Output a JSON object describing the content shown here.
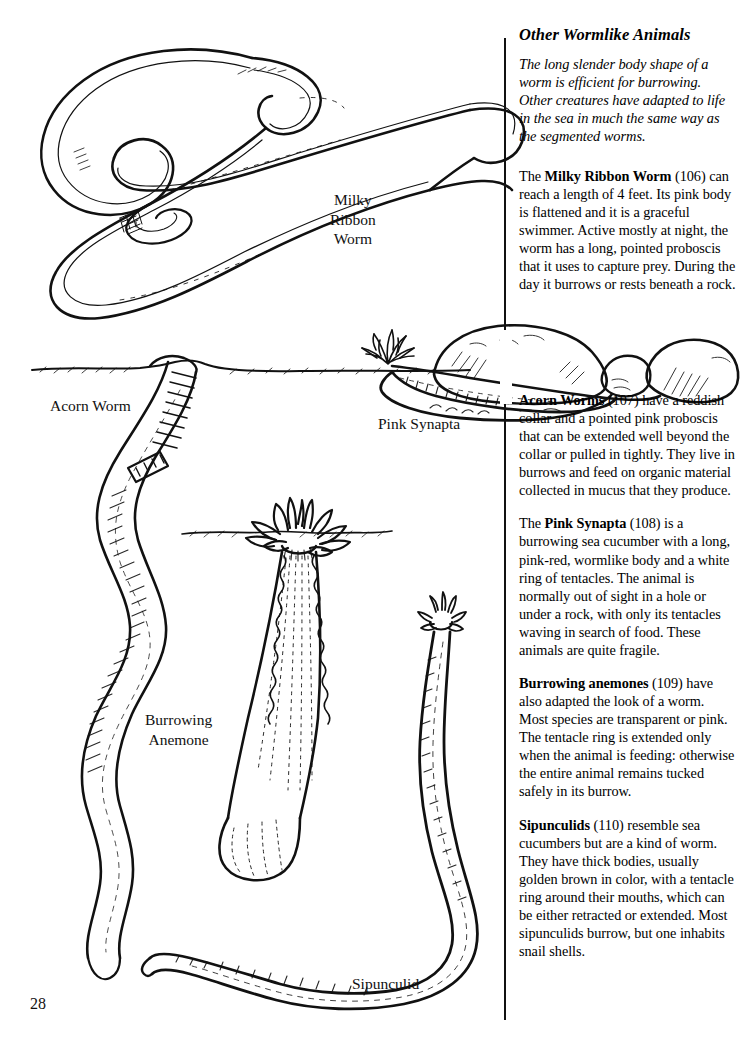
{
  "page": {
    "number": "28"
  },
  "sidebar": {
    "title": "Other Wormlike Animals",
    "intro": "The long slender body shape of a worm is efficient for burrowing. Other creatures have adapted to life in the sea in much the same way as the segmented worms.",
    "entries": [
      {
        "prefix": "The ",
        "lead": "Milky Ribbon Worm",
        "rest": " (106) can reach a length of 4 feet. Its pink body is flattened and it is a graceful swimmer. Active mostly at night, the worm has a long, pointed proboscis that it uses to capture prey. During the day it burrows or rests beneath a rock."
      },
      {
        "prefix": "",
        "lead": "Acorn Worms",
        "rest": " (107) have a reddish collar and a pointed pink proboscis that can be extended well beyond the collar or pulled in tightly. They live in burrows and feed on organic material collected in mucus that they produce."
      },
      {
        "prefix": "The ",
        "lead": "Pink Synapta",
        "rest": " (108) is a burrowing sea cucumber with a long, pink-red, wormlike body and a white ring of tentacles. The animal is normally out of sight in a hole or under a rock, with only its tentacles waving in search of food. These animals are quite fragile."
      },
      {
        "prefix": "",
        "lead": "Burrowing anemones",
        "rest": " (109) have also adapted the look of a worm. Most species are transparent or pink. The tentacle ring is extended only when the animal is feeding: otherwise the entire animal remains tucked safely in its burrow."
      },
      {
        "prefix": "",
        "lead": "Sipunculids",
        "rest": " (110) resemble sea cucumbers but are a kind of worm. They have thick bodies, usually golden brown in color, with a tentacle ring around their mouths, which can be either retracted or extended. Most sipunculids burrow, but one inhabits snail shells."
      }
    ]
  },
  "illustration": {
    "labels": {
      "milky_ribbon_worm": "Milky\nRibbon\nWorm",
      "acorn_worm": "Acorn Worm",
      "pink_synapta": "Pink Synapta",
      "burrowing_anemone": "Burrowing\nAnemone",
      "sipunculid": "Sipunculid"
    }
  },
  "colors": {
    "ink": "#111111",
    "paper": "#ffffff"
  }
}
